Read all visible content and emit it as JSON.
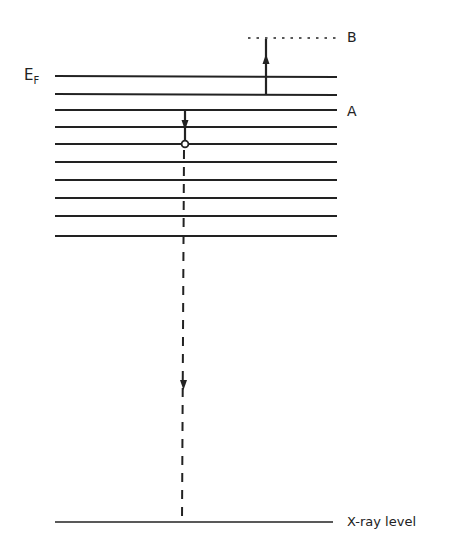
{
  "diagram": {
    "labels": {
      "fermi_main": "E",
      "fermi_sub": "F",
      "level_b": "B",
      "level_a": "A",
      "xray_level": "X-ray level"
    },
    "band_levels_y": [
      76,
      94,
      110,
      127,
      144,
      162,
      180,
      198,
      216,
      236
    ],
    "band_x_range": [
      55,
      337
    ],
    "level_b_y": 38,
    "xray_level_y": 522,
    "colors": {
      "line": "#222222",
      "background": "#ffffff"
    }
  }
}
